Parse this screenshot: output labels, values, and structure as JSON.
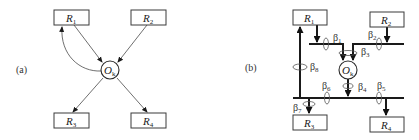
{
  "panels": [
    {
      "label": "(a)",
      "nodes": {
        "r1": {
          "name": "R",
          "sub": "1"
        },
        "r2": {
          "name": "R",
          "sub": "2"
        },
        "r3": {
          "name": "R",
          "sub": "3"
        },
        "r4": {
          "name": "R",
          "sub": "4"
        },
        "ok": {
          "name": "O",
          "sub": "k"
        }
      },
      "edges": [
        {
          "from": "R1",
          "to": "Ok"
        },
        {
          "from": "R2",
          "to": "Ok"
        },
        {
          "from": "Ok",
          "to": "R1",
          "style": "curved"
        },
        {
          "from": "Ok",
          "to": "R3"
        },
        {
          "from": "Ok",
          "to": "R4"
        }
      ]
    },
    {
      "label": "(b)",
      "nodes": {
        "r1": {
          "name": "R",
          "sub": "1"
        },
        "r2": {
          "name": "R",
          "sub": "2"
        },
        "r3": {
          "name": "R",
          "sub": "3"
        },
        "r4": {
          "name": "R",
          "sub": "4"
        },
        "ok": {
          "name": "O",
          "sub": "k"
        }
      },
      "betas": [
        {
          "sym": "β",
          "sub": "1"
        },
        {
          "sym": "β",
          "sub": "2"
        },
        {
          "sym": "β",
          "sub": "3"
        },
        {
          "sym": "β",
          "sub": "4"
        },
        {
          "sym": "β",
          "sub": "5"
        },
        {
          "sym": "β",
          "sub": "6"
        },
        {
          "sym": "β",
          "sub": "7"
        },
        {
          "sym": "β",
          "sub": "8"
        }
      ]
    }
  ]
}
